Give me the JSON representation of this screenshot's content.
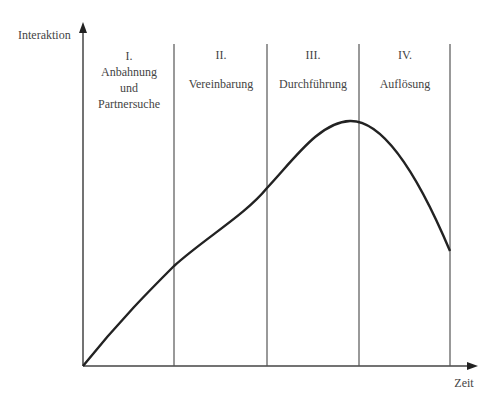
{
  "diagram": {
    "y_axis_label": "Interaktion",
    "x_axis_label": "Zeit",
    "phases": [
      {
        "numeral": "I.",
        "name_lines": [
          "Anbahnung",
          "und",
          "Partnersuche"
        ]
      },
      {
        "numeral": "II.",
        "name_lines": [
          "Vereinbarung"
        ]
      },
      {
        "numeral": "III.",
        "name_lines": [
          "Durchführung"
        ]
      },
      {
        "numeral": "IV.",
        "name_lines": [
          "Auflösung"
        ]
      }
    ],
    "curve_description": "Interaction rises steadily through phases I–III, peaks at the end of phase III, and declines in phase IV",
    "colors": {
      "line": "#333333",
      "text": "#444444",
      "background": "#ffffff"
    }
  }
}
